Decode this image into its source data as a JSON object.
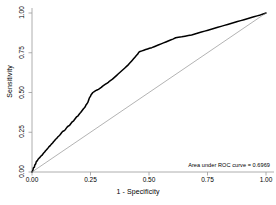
{
  "chart_data": {
    "type": "line",
    "title": "",
    "xlabel": "1 - Specificity",
    "ylabel": "Sensitivity",
    "xlim": [
      0,
      1
    ],
    "ylim": [
      0,
      1
    ],
    "grid": false,
    "legend": "none",
    "xticks": [
      "0.00",
      "0.25",
      "0.50",
      "0.75",
      "1.00"
    ],
    "xtick_values": [
      0,
      0.25,
      0.5,
      0.75,
      1
    ],
    "yticks": [
      "0.00",
      "0.25",
      "0.50",
      "0.75",
      "1.00"
    ],
    "ytick_values": [
      0,
      0.25,
      0.5,
      0.75,
      1
    ],
    "annotation": "Area under ROC curve = 0.6969",
    "auc": 0.6969,
    "series": [
      {
        "name": "ROC curve",
        "color": "#000000",
        "style": "step",
        "points": [
          [
            0.0,
            0.0
          ],
          [
            0.004,
            0.012
          ],
          [
            0.006,
            0.026
          ],
          [
            0.01,
            0.03
          ],
          [
            0.012,
            0.044
          ],
          [
            0.016,
            0.052
          ],
          [
            0.018,
            0.064
          ],
          [
            0.022,
            0.07
          ],
          [
            0.026,
            0.08
          ],
          [
            0.03,
            0.086
          ],
          [
            0.034,
            0.092
          ],
          [
            0.038,
            0.1
          ],
          [
            0.042,
            0.104
          ],
          [
            0.046,
            0.112
          ],
          [
            0.05,
            0.12
          ],
          [
            0.054,
            0.126
          ],
          [
            0.058,
            0.134
          ],
          [
            0.062,
            0.14
          ],
          [
            0.068,
            0.15
          ],
          [
            0.072,
            0.158
          ],
          [
            0.078,
            0.166
          ],
          [
            0.082,
            0.174
          ],
          [
            0.088,
            0.182
          ],
          [
            0.092,
            0.19
          ],
          [
            0.096,
            0.196
          ],
          [
            0.1,
            0.204
          ],
          [
            0.106,
            0.212
          ],
          [
            0.11,
            0.22
          ],
          [
            0.116,
            0.228
          ],
          [
            0.12,
            0.234
          ],
          [
            0.124,
            0.242
          ],
          [
            0.128,
            0.25
          ],
          [
            0.132,
            0.256
          ],
          [
            0.136,
            0.258
          ],
          [
            0.142,
            0.266
          ],
          [
            0.146,
            0.274
          ],
          [
            0.15,
            0.282
          ],
          [
            0.156,
            0.29
          ],
          [
            0.16,
            0.292
          ],
          [
            0.164,
            0.3
          ],
          [
            0.168,
            0.308
          ],
          [
            0.172,
            0.316
          ],
          [
            0.178,
            0.322
          ],
          [
            0.182,
            0.33
          ],
          [
            0.186,
            0.338
          ],
          [
            0.19,
            0.346
          ],
          [
            0.196,
            0.352
          ],
          [
            0.2,
            0.36
          ],
          [
            0.204,
            0.368
          ],
          [
            0.208,
            0.374
          ],
          [
            0.212,
            0.382
          ],
          [
            0.216,
            0.39
          ],
          [
            0.22,
            0.398
          ],
          [
            0.224,
            0.404
          ],
          [
            0.228,
            0.412
          ],
          [
            0.23,
            0.42
          ],
          [
            0.234,
            0.428
          ],
          [
            0.238,
            0.436
          ],
          [
            0.24,
            0.444
          ],
          [
            0.242,
            0.452
          ],
          [
            0.244,
            0.46
          ],
          [
            0.246,
            0.468
          ],
          [
            0.25,
            0.476
          ],
          [
            0.252,
            0.484
          ],
          [
            0.256,
            0.492
          ],
          [
            0.26,
            0.5
          ],
          [
            0.266,
            0.506
          ],
          [
            0.272,
            0.512
          ],
          [
            0.278,
            0.516
          ],
          [
            0.284,
            0.52
          ],
          [
            0.29,
            0.526
          ],
          [
            0.296,
            0.532
          ],
          [
            0.302,
            0.54
          ],
          [
            0.308,
            0.546
          ],
          [
            0.314,
            0.552
          ],
          [
            0.32,
            0.558
          ],
          [
            0.326,
            0.564
          ],
          [
            0.332,
            0.572
          ],
          [
            0.338,
            0.578
          ],
          [
            0.344,
            0.584
          ],
          [
            0.35,
            0.592
          ],
          [
            0.356,
            0.6
          ],
          [
            0.362,
            0.608
          ],
          [
            0.368,
            0.616
          ],
          [
            0.374,
            0.624
          ],
          [
            0.38,
            0.632
          ],
          [
            0.386,
            0.64
          ],
          [
            0.392,
            0.648
          ],
          [
            0.398,
            0.656
          ],
          [
            0.404,
            0.664
          ],
          [
            0.41,
            0.672
          ],
          [
            0.416,
            0.682
          ],
          [
            0.422,
            0.692
          ],
          [
            0.428,
            0.702
          ],
          [
            0.434,
            0.712
          ],
          [
            0.44,
            0.722
          ],
          [
            0.446,
            0.732
          ],
          [
            0.452,
            0.742
          ],
          [
            0.456,
            0.752
          ],
          [
            0.462,
            0.758
          ],
          [
            0.47,
            0.762
          ],
          [
            0.478,
            0.766
          ],
          [
            0.486,
            0.77
          ],
          [
            0.494,
            0.774
          ],
          [
            0.502,
            0.778
          ],
          [
            0.512,
            0.782
          ],
          [
            0.522,
            0.788
          ],
          [
            0.532,
            0.794
          ],
          [
            0.542,
            0.8
          ],
          [
            0.552,
            0.806
          ],
          [
            0.562,
            0.812
          ],
          [
            0.572,
            0.818
          ],
          [
            0.582,
            0.824
          ],
          [
            0.592,
            0.83
          ],
          [
            0.602,
            0.836
          ],
          [
            0.614,
            0.844
          ],
          [
            0.626,
            0.848
          ],
          [
            0.64,
            0.85
          ],
          [
            0.654,
            0.854
          ],
          [
            0.668,
            0.858
          ],
          [
            0.682,
            0.862
          ],
          [
            0.696,
            0.868
          ],
          [
            0.71,
            0.874
          ],
          [
            0.724,
            0.88
          ],
          [
            0.738,
            0.886
          ],
          [
            0.752,
            0.892
          ],
          [
            0.766,
            0.898
          ],
          [
            0.78,
            0.904
          ],
          [
            0.794,
            0.91
          ],
          [
            0.808,
            0.916
          ],
          [
            0.822,
            0.922
          ],
          [
            0.836,
            0.928
          ],
          [
            0.85,
            0.934
          ],
          [
            0.864,
            0.94
          ],
          [
            0.878,
            0.946
          ],
          [
            0.892,
            0.952
          ],
          [
            0.906,
            0.958
          ],
          [
            0.92,
            0.964
          ],
          [
            0.934,
            0.97
          ],
          [
            0.948,
            0.976
          ],
          [
            0.962,
            0.982
          ],
          [
            0.976,
            0.988
          ],
          [
            0.988,
            0.994
          ],
          [
            1.0,
            1.0
          ]
        ]
      },
      {
        "name": "Reference diagonal",
        "color": "#808080",
        "style": "line",
        "points": [
          [
            0,
            0
          ],
          [
            1,
            1
          ]
        ]
      }
    ]
  }
}
